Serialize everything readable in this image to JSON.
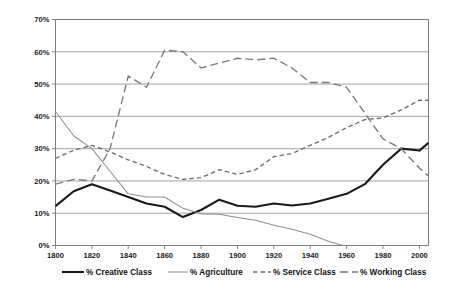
{
  "chart_data": {
    "type": "line",
    "title": "",
    "subtitle": "",
    "xlabel": "",
    "ylabel": "",
    "xlim": [
      1800,
      2005
    ],
    "ylim": [
      0,
      70
    ],
    "grid": true,
    "legend_position": "bottom",
    "x_tick_labels": [
      "1800",
      "1820",
      "1840",
      "1860",
      "1880",
      "1900",
      "1920",
      "1940",
      "1960",
      "1980",
      "2000"
    ],
    "x_ticks": [
      1800,
      1820,
      1840,
      1860,
      1880,
      1900,
      1920,
      1940,
      1960,
      1980,
      2000
    ],
    "y_tick_labels": [
      "0%",
      "10%",
      "20%",
      "30%",
      "40%",
      "50%",
      "60%",
      "70%"
    ],
    "y_ticks": [
      0,
      10,
      20,
      30,
      40,
      50,
      60,
      70
    ],
    "series": [
      {
        "name": "% Creative Class",
        "color": "#1a1a1a",
        "style": "solid-thick",
        "x": [
          1800,
          1810,
          1820,
          1830,
          1840,
          1850,
          1860,
          1870,
          1880,
          1890,
          1900,
          1910,
          1920,
          1930,
          1940,
          1950,
          1960,
          1970,
          1980,
          1990,
          2000,
          2005
        ],
        "values": [
          12.2,
          16.8,
          19.0,
          17.0,
          15.0,
          13.0,
          12.0,
          8.8,
          11.0,
          14.2,
          12.3,
          12.0,
          13.0,
          12.4,
          13.0,
          14.5,
          16.0,
          19.0,
          25.0,
          30.0,
          29.4,
          31.8
        ]
      },
      {
        "name": "% Agriculture",
        "color": "#8f8f8f",
        "style": "solid-thin",
        "x": [
          1800,
          1810,
          1820,
          1830,
          1840,
          1850,
          1860,
          1870,
          1880,
          1890,
          1900,
          1910,
          1920,
          1930,
          1940,
          1950,
          1958
        ],
        "values": [
          41.5,
          34.0,
          30.0,
          23.0,
          16.0,
          15.0,
          15.0,
          11.5,
          9.8,
          9.7,
          8.7,
          7.8,
          6.3,
          5.0,
          3.5,
          1.3,
          0.0
        ]
      },
      {
        "name": "% Service Class",
        "color": "#6d6d6d",
        "style": "dashed-short",
        "x": [
          1800,
          1810,
          1820,
          1830,
          1840,
          1850,
          1860,
          1870,
          1880,
          1890,
          1900,
          1910,
          1920,
          1930,
          1940,
          1950,
          1960,
          1970,
          1980,
          1990,
          2000,
          2005
        ],
        "values": [
          27.0,
          29.5,
          31.0,
          29.0,
          26.5,
          24.5,
          22.0,
          20.5,
          21.0,
          23.5,
          22.0,
          23.5,
          27.5,
          28.5,
          31.0,
          33.5,
          36.5,
          39.0,
          39.5,
          42.0,
          45.0,
          45.0
        ]
      },
      {
        "name": "% Working Class",
        "color": "#7a7a7a",
        "style": "dash-dot",
        "x": [
          1800,
          1810,
          1820,
          1830,
          1840,
          1850,
          1860,
          1870,
          1880,
          1890,
          1900,
          1910,
          1920,
          1930,
          1940,
          1950,
          1960,
          1970,
          1980,
          1990,
          2000,
          2005
        ],
        "values": [
          19.0,
          20.5,
          20.0,
          30.0,
          52.5,
          49.0,
          60.5,
          60.0,
          55.0,
          56.5,
          58.0,
          57.5,
          58.0,
          55.0,
          50.5,
          50.5,
          49.0,
          41.0,
          33.0,
          30.0,
          24.0,
          21.5
        ]
      }
    ]
  },
  "legend": {
    "items": [
      {
        "label": "% Creative Class",
        "style": "solid-thick",
        "color": "#1a1a1a"
      },
      {
        "label": "% Agriculture",
        "style": "solid-thin",
        "color": "#8f8f8f"
      },
      {
        "label": "% Service Class",
        "style": "dashed-short",
        "color": "#6d6d6d"
      },
      {
        "label": "% Working Class",
        "style": "dash-dot",
        "color": "#7a7a7a"
      }
    ]
  }
}
